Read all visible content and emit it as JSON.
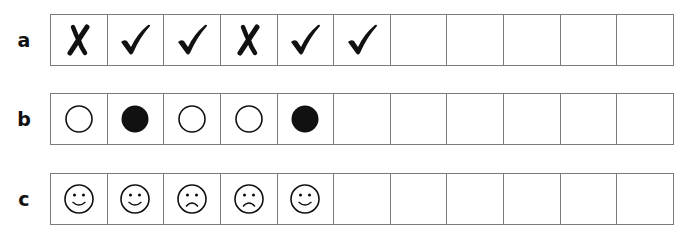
{
  "rows": [
    {
      "label": "a",
      "cells": [
        "cross-icon",
        "tick-icon",
        "tick-icon",
        "cross-icon",
        "tick-icon",
        "tick-icon",
        "",
        "",
        "",
        "",
        ""
      ]
    },
    {
      "label": "b",
      "cells": [
        "empty-circle-icon",
        "filled-circle-icon",
        "empty-circle-icon",
        "empty-circle-icon",
        "filled-circle-icon",
        "",
        "",
        "",
        "",
        "",
        ""
      ]
    },
    {
      "label": "c",
      "cells": [
        "happy-face-icon",
        "happy-face-icon",
        "sad-face-icon",
        "sad-face-icon",
        "happy-face-icon",
        "",
        "",
        "",
        "",
        "",
        ""
      ]
    }
  ],
  "colors": {
    "ink": "#111111",
    "border": "#7a7a7a",
    "background": "#ffffff"
  }
}
